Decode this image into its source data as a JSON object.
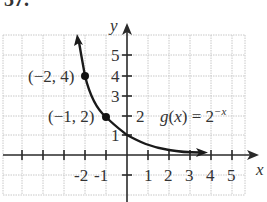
{
  "problem_number": "37.",
  "axes": {
    "x_label": "x",
    "y_label": "y",
    "x_ticks": [
      "-2",
      "-1",
      "1",
      "2",
      "3",
      "4",
      "5"
    ],
    "y_ticks": [
      "1",
      "2",
      "3",
      "4",
      "5"
    ]
  },
  "function": {
    "label_prefix": "g(x) = 2",
    "label_exponent": "−x"
  },
  "points": [
    {
      "label": "(−2, 4)",
      "x": -2,
      "y": 4
    },
    {
      "label": "(−1, 2)",
      "x": -1,
      "y": 2
    }
  ],
  "colors": {
    "curve": "#1a1a1a",
    "grid": "#c8c8c8",
    "axis": "#2a2a2a",
    "text": "#333333"
  }
}
